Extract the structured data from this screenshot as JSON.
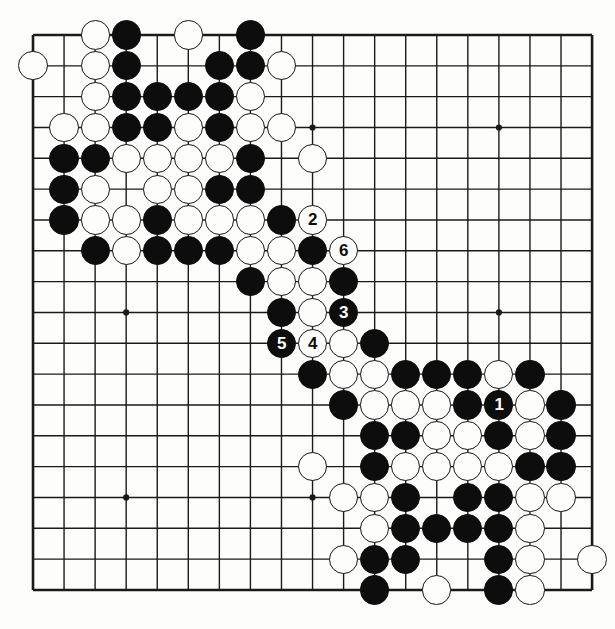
{
  "figure": {
    "type": "go-board-diagram",
    "caption": "",
    "board_size": 19,
    "colors": {
      "black_stone": "#0d0d0d",
      "white_stone": "#fdfdfc",
      "stone_outline": "#141414",
      "grid_line": "#1a1a1a",
      "board_background": "#fdfdfc"
    },
    "geometry": {
      "origin_x": 33,
      "origin_y": 35,
      "step_x": 31.06,
      "step_y": 30.83,
      "stone_radius": 14.6
    },
    "star_points": [
      {
        "col": 3,
        "row": 3
      },
      {
        "col": 9,
        "row": 3
      },
      {
        "col": 15,
        "row": 3
      },
      {
        "col": 3,
        "row": 9
      },
      {
        "col": 9,
        "row": 9
      },
      {
        "col": 15,
        "row": 9
      },
      {
        "col": 3,
        "row": 15
      },
      {
        "col": 9,
        "row": 15
      },
      {
        "col": 15,
        "row": 15
      }
    ],
    "move_numbers": [
      {
        "label": "1",
        "color": "black",
        "col": 15,
        "row": 12
      },
      {
        "label": "2",
        "color": "white",
        "col": 9,
        "row": 6
      },
      {
        "label": "3",
        "color": "black",
        "col": 10,
        "row": 9
      },
      {
        "label": "4",
        "color": "white",
        "col": 9,
        "row": 10
      },
      {
        "label": "5",
        "color": "black",
        "col": 8,
        "row": 10
      },
      {
        "label": "6",
        "color": "white",
        "col": 10,
        "row": 7
      }
    ],
    "stones": [
      {
        "col": 2,
        "row": 0,
        "color": "white"
      },
      {
        "col": 3,
        "row": 0,
        "color": "black"
      },
      {
        "col": 5,
        "row": 0,
        "color": "white"
      },
      {
        "col": 7,
        "row": 0,
        "color": "black"
      },
      {
        "col": 0,
        "row": 1,
        "color": "white"
      },
      {
        "col": 2,
        "row": 1,
        "color": "white"
      },
      {
        "col": 3,
        "row": 1,
        "color": "black"
      },
      {
        "col": 6,
        "row": 1,
        "color": "black"
      },
      {
        "col": 7,
        "row": 1,
        "color": "black"
      },
      {
        "col": 8,
        "row": 1,
        "color": "white"
      },
      {
        "col": 2,
        "row": 2,
        "color": "white"
      },
      {
        "col": 3,
        "row": 2,
        "color": "black"
      },
      {
        "col": 4,
        "row": 2,
        "color": "black"
      },
      {
        "col": 5,
        "row": 2,
        "color": "black"
      },
      {
        "col": 6,
        "row": 2,
        "color": "black"
      },
      {
        "col": 7,
        "row": 2,
        "color": "white"
      },
      {
        "col": 1,
        "row": 3,
        "color": "white"
      },
      {
        "col": 2,
        "row": 3,
        "color": "white"
      },
      {
        "col": 3,
        "row": 3,
        "color": "black"
      },
      {
        "col": 4,
        "row": 3,
        "color": "black"
      },
      {
        "col": 5,
        "row": 3,
        "color": "white"
      },
      {
        "col": 6,
        "row": 3,
        "color": "black"
      },
      {
        "col": 7,
        "row": 3,
        "color": "white"
      },
      {
        "col": 8,
        "row": 3,
        "color": "white"
      },
      {
        "col": 1,
        "row": 4,
        "color": "black"
      },
      {
        "col": 2,
        "row": 4,
        "color": "black"
      },
      {
        "col": 3,
        "row": 4,
        "color": "white"
      },
      {
        "col": 4,
        "row": 4,
        "color": "white"
      },
      {
        "col": 5,
        "row": 4,
        "color": "white"
      },
      {
        "col": 6,
        "row": 4,
        "color": "white"
      },
      {
        "col": 7,
        "row": 4,
        "color": "black"
      },
      {
        "col": 9,
        "row": 4,
        "color": "white"
      },
      {
        "col": 1,
        "row": 5,
        "color": "black"
      },
      {
        "col": 2,
        "row": 5,
        "color": "white"
      },
      {
        "col": 4,
        "row": 5,
        "color": "white"
      },
      {
        "col": 5,
        "row": 5,
        "color": "white"
      },
      {
        "col": 6,
        "row": 5,
        "color": "black"
      },
      {
        "col": 7,
        "row": 5,
        "color": "black"
      },
      {
        "col": 1,
        "row": 6,
        "color": "black"
      },
      {
        "col": 2,
        "row": 6,
        "color": "white"
      },
      {
        "col": 3,
        "row": 6,
        "color": "white"
      },
      {
        "col": 4,
        "row": 6,
        "color": "black"
      },
      {
        "col": 5,
        "row": 6,
        "color": "white"
      },
      {
        "col": 6,
        "row": 6,
        "color": "white"
      },
      {
        "col": 7,
        "row": 6,
        "color": "white"
      },
      {
        "col": 8,
        "row": 6,
        "color": "black"
      },
      {
        "col": 2,
        "row": 7,
        "color": "black"
      },
      {
        "col": 3,
        "row": 7,
        "color": "white"
      },
      {
        "col": 4,
        "row": 7,
        "color": "black"
      },
      {
        "col": 5,
        "row": 7,
        "color": "black"
      },
      {
        "col": 6,
        "row": 7,
        "color": "black"
      },
      {
        "col": 7,
        "row": 7,
        "color": "white"
      },
      {
        "col": 8,
        "row": 7,
        "color": "white"
      },
      {
        "col": 9,
        "row": 7,
        "color": "black"
      },
      {
        "col": 7,
        "row": 8,
        "color": "black"
      },
      {
        "col": 8,
        "row": 8,
        "color": "white"
      },
      {
        "col": 9,
        "row": 8,
        "color": "white"
      },
      {
        "col": 10,
        "row": 8,
        "color": "black"
      },
      {
        "col": 8,
        "row": 9,
        "color": "black"
      },
      {
        "col": 9,
        "row": 9,
        "color": "white"
      },
      {
        "col": 10,
        "row": 10,
        "color": "white"
      },
      {
        "col": 11,
        "row": 10,
        "color": "black"
      },
      {
        "col": 9,
        "row": 11,
        "color": "black"
      },
      {
        "col": 10,
        "row": 11,
        "color": "white"
      },
      {
        "col": 11,
        "row": 11,
        "color": "white"
      },
      {
        "col": 12,
        "row": 11,
        "color": "black"
      },
      {
        "col": 13,
        "row": 11,
        "color": "black"
      },
      {
        "col": 14,
        "row": 11,
        "color": "black"
      },
      {
        "col": 15,
        "row": 11,
        "color": "white"
      },
      {
        "col": 16,
        "row": 11,
        "color": "black"
      },
      {
        "col": 10,
        "row": 12,
        "color": "black"
      },
      {
        "col": 11,
        "row": 12,
        "color": "white"
      },
      {
        "col": 12,
        "row": 12,
        "color": "white"
      },
      {
        "col": 13,
        "row": 12,
        "color": "white"
      },
      {
        "col": 14,
        "row": 12,
        "color": "black"
      },
      {
        "col": 16,
        "row": 12,
        "color": "white"
      },
      {
        "col": 17,
        "row": 12,
        "color": "black"
      },
      {
        "col": 11,
        "row": 13,
        "color": "black"
      },
      {
        "col": 12,
        "row": 13,
        "color": "black"
      },
      {
        "col": 13,
        "row": 13,
        "color": "white"
      },
      {
        "col": 14,
        "row": 13,
        "color": "white"
      },
      {
        "col": 15,
        "row": 13,
        "color": "black"
      },
      {
        "col": 16,
        "row": 13,
        "color": "white"
      },
      {
        "col": 17,
        "row": 13,
        "color": "black"
      },
      {
        "col": 11,
        "row": 14,
        "color": "black"
      },
      {
        "col": 12,
        "row": 14,
        "color": "white"
      },
      {
        "col": 13,
        "row": 14,
        "color": "white"
      },
      {
        "col": 14,
        "row": 14,
        "color": "white"
      },
      {
        "col": 15,
        "row": 14,
        "color": "white"
      },
      {
        "col": 16,
        "row": 14,
        "color": "black"
      },
      {
        "col": 17,
        "row": 14,
        "color": "black"
      },
      {
        "col": 9,
        "row": 14,
        "color": "white"
      },
      {
        "col": 10,
        "row": 15,
        "color": "white"
      },
      {
        "col": 11,
        "row": 15,
        "color": "white"
      },
      {
        "col": 12,
        "row": 15,
        "color": "black"
      },
      {
        "col": 14,
        "row": 15,
        "color": "black"
      },
      {
        "col": 15,
        "row": 15,
        "color": "black"
      },
      {
        "col": 16,
        "row": 15,
        "color": "white"
      },
      {
        "col": 17,
        "row": 15,
        "color": "white"
      },
      {
        "col": 11,
        "row": 16,
        "color": "white"
      },
      {
        "col": 12,
        "row": 16,
        "color": "black"
      },
      {
        "col": 13,
        "row": 16,
        "color": "black"
      },
      {
        "col": 14,
        "row": 16,
        "color": "black"
      },
      {
        "col": 15,
        "row": 16,
        "color": "black"
      },
      {
        "col": 16,
        "row": 16,
        "color": "white"
      },
      {
        "col": 10,
        "row": 17,
        "color": "white"
      },
      {
        "col": 11,
        "row": 17,
        "color": "black"
      },
      {
        "col": 12,
        "row": 17,
        "color": "black"
      },
      {
        "col": 15,
        "row": 17,
        "color": "black"
      },
      {
        "col": 16,
        "row": 17,
        "color": "white"
      },
      {
        "col": 18,
        "row": 17,
        "color": "white"
      },
      {
        "col": 11,
        "row": 18,
        "color": "black"
      },
      {
        "col": 13,
        "row": 18,
        "color": "white"
      },
      {
        "col": 15,
        "row": 18,
        "color": "black"
      },
      {
        "col": 16,
        "row": 18,
        "color": "white"
      }
    ]
  }
}
